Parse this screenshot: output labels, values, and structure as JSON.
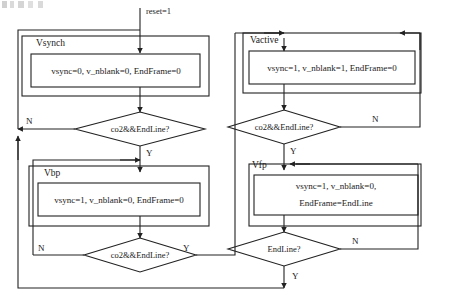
{
  "diagram": {
    "title_fragment": "",
    "entry": {
      "label": "reset=1"
    },
    "states": [
      {
        "id": "vsynch",
        "name": "Vsynch",
        "action_lines": [
          "vsync=0, v_nblank=0, EndFrame=0"
        ]
      },
      {
        "id": "vbp",
        "name": "Vbp",
        "action_lines": [
          "vsync=1, v_nblank=0, EndFrame=0"
        ]
      },
      {
        "id": "vactive",
        "name": "Vactive",
        "action_lines": [
          "vsync=1, v_nblank=1, EndFrame=0"
        ]
      },
      {
        "id": "vfp",
        "name": "Vfp",
        "action_lines": [
          "vsync=1, v_nblank=0,",
          "EndFrame=EndLine"
        ]
      }
    ],
    "decisions": [
      {
        "id": "vsynch-cond",
        "text": "co2&&EndLine?",
        "no_label": "N",
        "yes_label": "Y"
      },
      {
        "id": "vbp-cond",
        "text": "co2&&EndLine?",
        "no_label": "N",
        "yes_label": "Y"
      },
      {
        "id": "vactive-cond",
        "text": "co2&&EndLine?",
        "no_label": "N",
        "yes_label": "Y"
      },
      {
        "id": "vfp-cond",
        "text": "EndLine?",
        "no_label": "N",
        "yes_label": "Y"
      }
    ],
    "colors": {
      "stroke": "#222222",
      "text": "#1a1a1a",
      "background": "#ffffff"
    }
  }
}
